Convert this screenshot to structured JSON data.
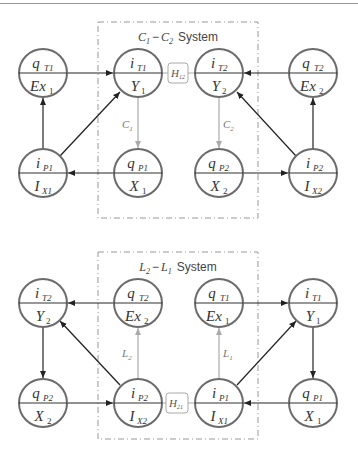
{
  "colors": {
    "node_stroke": "#6b6b6b",
    "edge_dark": "#222222",
    "edge_light": "#aaaaaa",
    "system_box": "#999999",
    "coupling_box": "#aaaaaa"
  },
  "systems": [
    {
      "title": {
        "a": "C",
        "a_sub": "1",
        "sep": "−",
        "b": "C",
        "b_sub": "2",
        "suffix": "System"
      },
      "nodes": [
        {
          "id": "qT1",
          "top": "q",
          "top_sub": "T1",
          "bottom": "Ex",
          "bottom_sub": "1"
        },
        {
          "id": "iT1",
          "top": "i",
          "top_sub": "T1",
          "bottom": "Y",
          "bottom_sub": "1"
        },
        {
          "id": "iT2",
          "top": "i",
          "top_sub": "T2",
          "bottom": "Y",
          "bottom_sub": "2"
        },
        {
          "id": "qT2",
          "top": "q",
          "top_sub": "T2",
          "bottom": "Ex",
          "bottom_sub": "2"
        },
        {
          "id": "iP1",
          "top": "i",
          "top_sub": "P1",
          "bottom": "I",
          "bottom_sub": "X1"
        },
        {
          "id": "qP1",
          "top": "q",
          "top_sub": "P1",
          "bottom": "X",
          "bottom_sub": "1"
        },
        {
          "id": "qP2",
          "top": "q",
          "top_sub": "P2",
          "bottom": "X",
          "bottom_sub": "2"
        },
        {
          "id": "iP2",
          "top": "i",
          "top_sub": "P2",
          "bottom": "I",
          "bottom_sub": "X2"
        }
      ],
      "coupling": {
        "label": "H",
        "sub": "12"
      },
      "edge_labels": [
        {
          "label": "C",
          "sub": "1"
        },
        {
          "label": "C",
          "sub": "2"
        }
      ]
    },
    {
      "title": {
        "a": "L",
        "a_sub": "2",
        "sep": "−",
        "b": "L",
        "b_sub": "1",
        "suffix": "System"
      },
      "nodes": [
        {
          "id": "iT2",
          "top": "i",
          "top_sub": "T2",
          "bottom": "Y",
          "bottom_sub": "2"
        },
        {
          "id": "qT2",
          "top": "q",
          "top_sub": "T2",
          "bottom": "Ex",
          "bottom_sub": "2"
        },
        {
          "id": "qT1",
          "top": "q",
          "top_sub": "T1",
          "bottom": "Ex",
          "bottom_sub": "1"
        },
        {
          "id": "iT1",
          "top": "i",
          "top_sub": "T1",
          "bottom": "Y",
          "bottom_sub": "1"
        },
        {
          "id": "qP2",
          "top": "q",
          "top_sub": "P2",
          "bottom": "X",
          "bottom_sub": "2"
        },
        {
          "id": "iP2",
          "top": "i",
          "top_sub": "P2",
          "bottom": "I",
          "bottom_sub": "X2"
        },
        {
          "id": "iP1",
          "top": "i",
          "top_sub": "P1",
          "bottom": "I",
          "bottom_sub": "X1"
        },
        {
          "id": "qP1",
          "top": "q",
          "top_sub": "P1",
          "bottom": "X",
          "bottom_sub": "1"
        }
      ],
      "coupling": {
        "label": "H",
        "sub": "21"
      },
      "edge_labels": [
        {
          "label": "L",
          "sub": "2"
        },
        {
          "label": "L",
          "sub": "1"
        }
      ]
    }
  ]
}
